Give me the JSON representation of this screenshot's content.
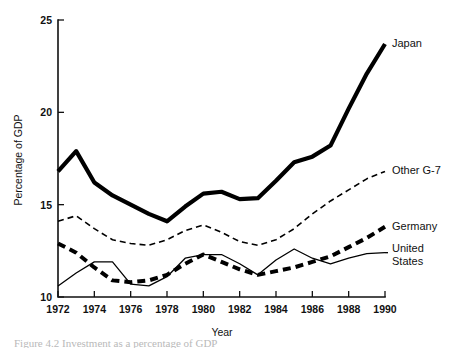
{
  "chart_data": {
    "type": "line",
    "title": "",
    "xlabel": "Year",
    "ylabel": "Percentage of GDP",
    "xlim": [
      1972,
      1990
    ],
    "ylim": [
      10,
      25
    ],
    "grid": false,
    "legend_position": "right-inline-labels",
    "xticks": [
      1972,
      1974,
      1976,
      1978,
      1980,
      1982,
      1984,
      1986,
      1988,
      1990
    ],
    "xtick_labels": [
      "1972",
      "1974",
      "1976",
      "1978",
      "1980",
      "1982",
      "1984",
      "1986",
      "1988",
      "1990"
    ],
    "yticks": [
      10,
      15,
      20,
      25
    ],
    "ytick_labels": [
      "10",
      "15",
      "20",
      "25"
    ],
    "x": [
      1972,
      1973,
      1974,
      1975,
      1976,
      1977,
      1978,
      1979,
      1980,
      1981,
      1982,
      1983,
      1984,
      1985,
      1986,
      1987,
      1988,
      1989,
      1990
    ],
    "series": [
      {
        "name": "Japan",
        "style": "solid-thick",
        "label": "Japan",
        "values": [
          16.8,
          17.9,
          16.2,
          15.5,
          15.0,
          14.5,
          14.1,
          14.9,
          15.6,
          15.7,
          15.3,
          15.35,
          16.3,
          17.3,
          17.6,
          18.2,
          20.2,
          22.1,
          23.7
        ]
      },
      {
        "name": "Other G-7",
        "style": "dashed-thin",
        "label": "Other G-7",
        "values": [
          14.1,
          14.4,
          13.7,
          13.1,
          12.9,
          12.8,
          13.1,
          13.6,
          13.9,
          13.5,
          13.0,
          12.8,
          13.1,
          13.7,
          14.5,
          15.2,
          15.8,
          16.4,
          16.8
        ]
      },
      {
        "name": "Germany",
        "style": "dashed-thick",
        "label": "Germany",
        "values": [
          12.9,
          12.4,
          11.6,
          10.9,
          10.8,
          10.9,
          11.2,
          11.8,
          12.3,
          11.9,
          11.5,
          11.2,
          11.4,
          11.6,
          11.9,
          12.2,
          12.7,
          13.2,
          13.8
        ]
      },
      {
        "name": "United States",
        "style": "solid-thin",
        "label": "United States",
        "label_line2": "States",
        "values": [
          10.6,
          11.3,
          11.9,
          11.9,
          10.7,
          10.6,
          11.1,
          12.1,
          12.3,
          12.3,
          11.8,
          11.2,
          12.0,
          12.6,
          12.1,
          11.8,
          12.1,
          12.35,
          12.4
        ]
      }
    ]
  },
  "figure": {
    "caption": "Figure 4.2  Investment as a percentage of GDP"
  }
}
